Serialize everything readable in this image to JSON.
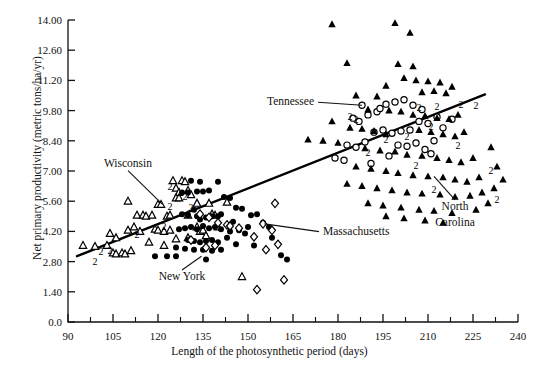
{
  "chart_data": {
    "type": "scatter",
    "title": "",
    "xlabel": "Length of the photosynthetic period (days)",
    "ylabel": "Net primary productivity (metric tons/ha/yr)",
    "xlim": [
      90,
      240
    ],
    "ylim": [
      0.0,
      14.0
    ],
    "xticks": [
      90,
      105,
      120,
      135,
      150,
      165,
      180,
      195,
      210,
      225,
      240
    ],
    "xtick_labels": [
      "90",
      "105",
      "120",
      "135",
      "150",
      "165",
      "180",
      "195",
      "210",
      "225",
      "240"
    ],
    "yticks": [
      0.0,
      1.4,
      2.8,
      4.2,
      5.6,
      7.0,
      8.4,
      9.8,
      11.2,
      12.6,
      14.0
    ],
    "ytick_labels": [
      "0.0",
      "1.40",
      "2.80",
      "4.20",
      "5.60",
      "7.00",
      "8.40",
      "9.80",
      "11.20",
      "12.60",
      "14.00"
    ],
    "minor_xticks": [
      97.5,
      112.5,
      127.5,
      142.5,
      157.5,
      172.5,
      187.5,
      202.5,
      217.5,
      232.5
    ],
    "grid": false,
    "legend_position": "none",
    "trendline": {
      "label": "regression line",
      "x_start": 93,
      "y_start": 3.05,
      "x_end": 229,
      "y_end": 10.55
    },
    "annotations": [
      {
        "name": "Wisconsin",
        "text": "Wisconsin",
        "tx": 110,
        "ty": 7.2,
        "px": 121.5,
        "py": 5.45,
        "anchor": "middle"
      },
      {
        "name": "New York",
        "text": "New York",
        "tx": 128,
        "ty": 1.95,
        "px": 134.5,
        "py": 3.05,
        "anchor": "middle"
      },
      {
        "name": "Tennessee",
        "text": "Tennessee",
        "tx": 172,
        "ty": 10.05,
        "px": 188.0,
        "py": 10.05,
        "anchor": "end"
      },
      {
        "name": "Massachusetts",
        "text": "Massachusetts",
        "tx": 175,
        "ty": 4.05,
        "px": 155.5,
        "py": 4.55,
        "anchor": "start"
      },
      {
        "name": "North Carolina",
        "text": "North",
        "tx": 219,
        "ty": 5.2,
        "px": 212.0,
        "py": 6.75,
        "anchor": "middle"
      },
      {
        "name": "North Carolina-line2",
        "text": "Carolina",
        "tx": 219,
        "ty": 4.45,
        "px": null,
        "py": null,
        "anchor": "middle"
      }
    ],
    "series": [
      {
        "name": "Wisconsin",
        "marker": "open-triangle",
        "color": "#000000",
        "points": [
          [
            95,
            3.55
          ],
          [
            99,
            3.5
          ],
          [
            103,
            3.55
          ],
          [
            104,
            4.1
          ],
          [
            105,
            3.2
          ],
          [
            106,
            3.15
          ],
          [
            106,
            3.9
          ],
          [
            108,
            3.2
          ],
          [
            109,
            3.15
          ],
          [
            110,
            4.25
          ],
          [
            111,
            3.3
          ],
          [
            112,
            4.4
          ],
          [
            113,
            4.95
          ],
          [
            110,
            5.6
          ],
          [
            114,
            4.2
          ],
          [
            115,
            4.95
          ],
          [
            116,
            4.9
          ],
          [
            117,
            3.7
          ],
          [
            118,
            4.95
          ],
          [
            119,
            4.3
          ],
          [
            120,
            4.25
          ],
          [
            120,
            5.45
          ],
          [
            121,
            5.45
          ],
          [
            122,
            4.2
          ],
          [
            122,
            3.55
          ],
          [
            123,
            4.9
          ],
          [
            124,
            4.95
          ],
          [
            125,
            6.55
          ],
          [
            126,
            6.2
          ],
          [
            127,
            6.0
          ],
          [
            128,
            6.55
          ],
          [
            129,
            6.5
          ],
          [
            130,
            6.1
          ],
          [
            131,
            5.9
          ],
          [
            126,
            5.75
          ],
          [
            127,
            5.75
          ],
          [
            124,
            4.25
          ],
          [
            130,
            4.95
          ],
          [
            133,
            4.4
          ],
          [
            134,
            4.2
          ],
          [
            135,
            4.25
          ],
          [
            136,
            4.0
          ],
          [
            137,
            5.5
          ],
          [
            130,
            3.9
          ],
          [
            126,
            3.85
          ],
          [
            140,
            4.4
          ],
          [
            143,
            5.55
          ],
          [
            148,
            2.1
          ],
          [
            139,
            4.95
          ],
          [
            133,
            5.5
          ],
          [
            138,
            5.0
          ]
        ],
        "duplicate_labels": [
          {
            "x": 101,
            "y": 3.3,
            "n": "2"
          },
          [
            0
          ],
          {
            "x": 104,
            "y": 3.35,
            "n": "2"
          },
          {
            "x": 99,
            "y": 2.85,
            "n": "2"
          },
          {
            "x": 113,
            "y": 4.1,
            "n": "2"
          },
          {
            "x": 124,
            "y": 5.4,
            "n": "2"
          },
          {
            "x": 124,
            "y": 6.3,
            "n": "2"
          },
          {
            "x": 129,
            "y": 5.85,
            "n": "2"
          },
          {
            "x": 131,
            "y": 5.35,
            "n": "2"
          },
          {
            "x": 122,
            "y": 4.45,
            "n": "2"
          }
        ]
      },
      {
        "name": "New York",
        "marker": "filled-circle",
        "color": "#000000",
        "points": [
          [
            131,
            6.55
          ],
          [
            134,
            6.5
          ],
          [
            128,
            6.0
          ],
          [
            130,
            6.0
          ],
          [
            133,
            6.05
          ],
          [
            135,
            6.05
          ],
          [
            137,
            6.1
          ],
          [
            140,
            6.5
          ],
          [
            142,
            5.8
          ],
          [
            128,
            5.0
          ],
          [
            130,
            4.95
          ],
          [
            132,
            5.2
          ],
          [
            133,
            4.9
          ],
          [
            134,
            4.75
          ],
          [
            136,
            4.85
          ],
          [
            138,
            4.9
          ],
          [
            140,
            4.9
          ],
          [
            141,
            5.0
          ],
          [
            127,
            4.3
          ],
          [
            129,
            4.35
          ],
          [
            131,
            4.4
          ],
          [
            133,
            4.3
          ],
          [
            135,
            4.45
          ],
          [
            137,
            4.35
          ],
          [
            139,
            4.4
          ],
          [
            141,
            4.3
          ],
          [
            144,
            4.2
          ],
          [
            147,
            4.25
          ],
          [
            150,
            4.4
          ],
          [
            130,
            3.8
          ],
          [
            132,
            3.75
          ],
          [
            134,
            3.7
          ],
          [
            136,
            3.75
          ],
          [
            138,
            3.8
          ],
          [
            140,
            3.7
          ],
          [
            143,
            3.9
          ],
          [
            146,
            3.6
          ],
          [
            149,
            4.1
          ],
          [
            126,
            3.45
          ],
          [
            129,
            3.4
          ],
          [
            132,
            3.35
          ],
          [
            135,
            3.35
          ],
          [
            138,
            3.3
          ],
          [
            141,
            3.35
          ],
          [
            119,
            3.05
          ],
          [
            123,
            3.05
          ],
          [
            126,
            3.05
          ],
          [
            136,
            2.9
          ],
          [
            152,
            3.55
          ],
          [
            155,
            4.6
          ],
          [
            157,
            4.4
          ],
          [
            158,
            3.9
          ],
          [
            161,
            3.1
          ],
          [
            163,
            2.9
          ],
          [
            151,
            4.95
          ],
          [
            153,
            5.0
          ],
          [
            146,
            5.3
          ],
          [
            148,
            5.25
          ],
          [
            144,
            5.75
          ],
          [
            145,
            4.65
          ]
        ],
        "duplicate_labels": []
      },
      {
        "name": "Massachusetts",
        "marker": "open-diamond",
        "color": "#000000",
        "points": [
          [
            134,
            5.0
          ],
          [
            137,
            4.85
          ],
          [
            140,
            4.6
          ],
          [
            143,
            4.5
          ],
          [
            144,
            4.45
          ],
          [
            147,
            4.35
          ],
          [
            131,
            3.8
          ],
          [
            139,
            3.55
          ],
          [
            136,
            3.45
          ],
          [
            152,
            3.95
          ],
          [
            155,
            4.55
          ],
          [
            158,
            4.25
          ],
          [
            160,
            3.6
          ],
          [
            156,
            3.35
          ],
          [
            159,
            5.5
          ],
          [
            153,
            1.5
          ],
          [
            162,
            1.95
          ]
        ],
        "duplicate_labels": []
      },
      {
        "name": "Tennessee",
        "marker": "open-circle",
        "color": "#000000",
        "points": [
          [
            188,
            10.05
          ],
          [
            185,
            9.45
          ],
          [
            187,
            9.3
          ],
          [
            190,
            9.6
          ],
          [
            193,
            9.75
          ],
          [
            196,
            10.1
          ],
          [
            199,
            10.2
          ],
          [
            202,
            10.3
          ],
          [
            205,
            10.05
          ],
          [
            208,
            9.85
          ],
          [
            192,
            8.8
          ],
          [
            195,
            8.9
          ],
          [
            198,
            8.75
          ],
          [
            201,
            8.85
          ],
          [
            204,
            8.9
          ],
          [
            207,
            9.3
          ],
          [
            210,
            9.2
          ],
          [
            213,
            9.5
          ],
          [
            183,
            8.2
          ],
          [
            186,
            8.1
          ],
          [
            189,
            8.35
          ],
          [
            200,
            8.2
          ],
          [
            203,
            8.15
          ],
          [
            206,
            8.3
          ],
          [
            209,
            8.0
          ],
          [
            212,
            8.4
          ],
          [
            179,
            7.6
          ],
          [
            182,
            7.5
          ],
          [
            197,
            7.7
          ],
          [
            211,
            7.8
          ],
          [
            215,
            9.0
          ],
          [
            218,
            9.4
          ],
          [
            194,
            9.9
          ],
          [
            191,
            7.35
          ]
        ],
        "duplicate_labels": [
          {
            "x": 184,
            "y": 9.55,
            "n": "2"
          },
          {
            "x": 196,
            "y": 8.5,
            "n": "2"
          },
          {
            "x": 203,
            "y": 8.6,
            "n": "2"
          },
          {
            "x": 207,
            "y": 9.95,
            "n": "2"
          },
          {
            "x": 213,
            "y": 10.0,
            "n": "2"
          },
          {
            "x": 190,
            "y": 7.9,
            "n": "2"
          }
        ]
      },
      {
        "name": "North Carolina",
        "marker": "filled-triangle",
        "color": "#000000",
        "points": [
          [
            178,
            13.8
          ],
          [
            199,
            13.85
          ],
          [
            204,
            13.4
          ],
          [
            183,
            12.0
          ],
          [
            200,
            11.95
          ],
          [
            205,
            11.85
          ],
          [
            202,
            11.3
          ],
          [
            206,
            11.2
          ],
          [
            210,
            11.15
          ],
          [
            214,
            11.1
          ],
          [
            196,
            10.95
          ],
          [
            208,
            10.65
          ],
          [
            212,
            10.7
          ],
          [
            216,
            10.6
          ],
          [
            218,
            10.9
          ],
          [
            186,
            10.5
          ],
          [
            193,
            10.45
          ],
          [
            190,
            9.85
          ],
          [
            197,
            9.8
          ],
          [
            201,
            9.75
          ],
          [
            205,
            9.6
          ],
          [
            209,
            9.55
          ],
          [
            213,
            9.45
          ],
          [
            217,
            9.4
          ],
          [
            220,
            9.6
          ],
          [
            184,
            9.0
          ],
          [
            188,
            8.95
          ],
          [
            192,
            8.85
          ],
          [
            196,
            8.7
          ],
          [
            207,
            8.9
          ],
          [
            211,
            8.8
          ],
          [
            215,
            8.7
          ],
          [
            219,
            8.6
          ],
          [
            222,
            8.8
          ],
          [
            170,
            8.45
          ],
          [
            180,
            8.3
          ],
          [
            189,
            8.05
          ],
          [
            194,
            7.95
          ],
          [
            199,
            7.9
          ],
          [
            203,
            7.75
          ],
          [
            208,
            7.7
          ],
          [
            213,
            7.6
          ],
          [
            217,
            7.5
          ],
          [
            221,
            7.4
          ],
          [
            225,
            7.6
          ],
          [
            186,
            7.2
          ],
          [
            191,
            7.1
          ],
          [
            196,
            7.0
          ],
          [
            200,
            6.9
          ],
          [
            205,
            6.8
          ],
          [
            210,
            6.75
          ],
          [
            215,
            6.7
          ],
          [
            219,
            6.6
          ],
          [
            223,
            6.5
          ],
          [
            227,
            6.7
          ],
          [
            183,
            6.4
          ],
          [
            188,
            6.3
          ],
          [
            193,
            6.2
          ],
          [
            198,
            6.1
          ],
          [
            203,
            6.0
          ],
          [
            208,
            5.95
          ],
          [
            214,
            5.9
          ],
          [
            219,
            5.8
          ],
          [
            224,
            5.85
          ],
          [
            228,
            6.0
          ],
          [
            190,
            5.5
          ],
          [
            195,
            5.4
          ],
          [
            201,
            5.3
          ],
          [
            207,
            5.2
          ],
          [
            212,
            5.15
          ],
          [
            218,
            5.05
          ],
          [
            226,
            5.2
          ],
          [
            230,
            5.5
          ],
          [
            232,
            6.2
          ],
          [
            196,
            4.9
          ],
          [
            202,
            4.8
          ],
          [
            209,
            4.7
          ],
          [
            215,
            4.6
          ],
          [
            233,
            7.2
          ],
          [
            231,
            8.1
          ],
          [
            235,
            6.6
          ],
          [
            178,
            9.3
          ],
          [
            175,
            8.4
          ]
        ],
        "duplicate_labels": [
          {
            "x": 221,
            "y": 10.1,
            "n": "2"
          },
          {
            "x": 226,
            "y": 10.05,
            "n": "2"
          },
          {
            "x": 211,
            "y": 9.1,
            "n": "2"
          },
          {
            "x": 206,
            "y": 7.3,
            "n": "2"
          },
          {
            "x": 220,
            "y": 8.2,
            "n": "2"
          },
          {
            "x": 231,
            "y": 7.05,
            "n": "2"
          },
          {
            "x": 233,
            "y": 5.7,
            "n": "2"
          },
          {
            "x": 212,
            "y": 6.15,
            "n": "2"
          },
          {
            "x": 186,
            "y": 9.4,
            "n": "2"
          }
        ]
      }
    ]
  }
}
